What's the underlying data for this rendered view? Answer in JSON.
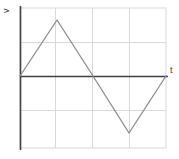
{
  "figure": {
    "name": "triangular-waveform-plot",
    "background_color": "#ffffff"
  },
  "labels": {
    "y_axis": "v",
    "x_axis": "t"
  },
  "colors": {
    "grid": "#d9d9d9",
    "border": "#d9d9d9",
    "axis": "#404040",
    "waveform": "#8c8c8c"
  },
  "chart_data": {
    "type": "line",
    "title": "",
    "xlabel": "t",
    "ylabel": "v",
    "grid": true,
    "legend": null,
    "xlim": [
      0,
      4
    ],
    "ylim": [
      -2,
      2
    ],
    "x": [
      0,
      1,
      2,
      3,
      4
    ],
    "values": [
      0,
      1.65,
      0,
      -1.65,
      0
    ],
    "series": [
      {
        "name": "triangular wave",
        "x": [
          0,
          1,
          2,
          3,
          4
        ],
        "values": [
          0,
          1.65,
          0,
          -1.65,
          0
        ]
      }
    ],
    "xticks": [
      0,
      1,
      2,
      3,
      4
    ],
    "xticklabels": [
      "",
      "",
      "",
      "",
      ""
    ],
    "yticks": [
      -2,
      -1,
      0,
      1,
      2
    ],
    "yticklabels": [
      "",
      "",
      "",
      "",
      ""
    ],
    "annotations": []
  },
  "geometry": {
    "plot_left": 20,
    "plot_right": 166,
    "plot_top": 8,
    "plot_bottom": 148,
    "zero_line_y": 76,
    "vertical_gridlines_x": [
      55,
      92,
      129
    ],
    "horizontal_gridlines_y": [
      42,
      110
    ],
    "waveform_points": "20,76 57,20 93,76 129,133 166,76"
  }
}
